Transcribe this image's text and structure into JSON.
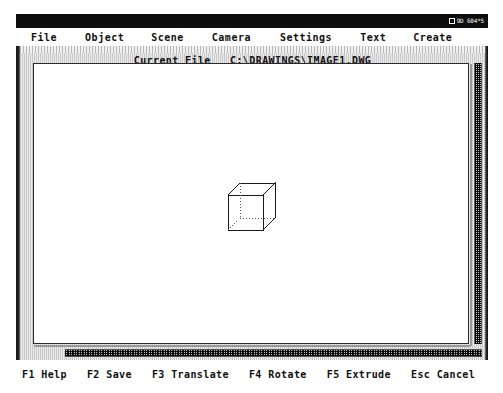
{
  "window": {
    "title_indicator": "9D 604*5",
    "indicator_icon": "screen-mode-icon"
  },
  "menubar": {
    "items": [
      {
        "label": "File",
        "name": "menu-file"
      },
      {
        "label": "Object",
        "name": "menu-object"
      },
      {
        "label": "Scene",
        "name": "menu-scene"
      },
      {
        "label": "Camera",
        "name": "menu-camera"
      },
      {
        "label": "Settings",
        "name": "menu-settings"
      },
      {
        "label": "Text",
        "name": "menu-text"
      },
      {
        "label": "Create",
        "name": "menu-create"
      }
    ]
  },
  "status": {
    "current_file_label": "Current File",
    "current_file_path": "C:\\DRAWINGS\\IMAGE1.DWG",
    "current_file_line": "Current File   C:\\DRAWINGS\\IMAGE1.DWG"
  },
  "canvas": {
    "background_color": "#ffffff",
    "object_name": "wireframe-cube",
    "object_type": "cube",
    "stroke_color": "#1a1a1a",
    "hidden_edge_style": "dotted"
  },
  "scrollbars": {
    "vertical_name": "vertical-scrollbar",
    "horizontal_name": "horizontal-scrollbar"
  },
  "function_keys": {
    "items": [
      {
        "key": "F1",
        "action": "Help",
        "label": "F1 Help"
      },
      {
        "key": "F2",
        "action": "Save",
        "label": "F2 Save"
      },
      {
        "key": "F3",
        "action": "Translate",
        "label": "F3 Translate"
      },
      {
        "key": "F4",
        "action": "Rotate",
        "label": "F4 Rotate"
      },
      {
        "key": "F5",
        "action": "Extrude",
        "label": "F5 Extrude"
      },
      {
        "key": "Esc",
        "action": "Cancel",
        "label": "Esc Cancel"
      }
    ]
  },
  "colors": {
    "title_bar": "#0d0d0d",
    "frame": "#d8d8d8",
    "text": "#101010",
    "canvas": "#ffffff"
  }
}
